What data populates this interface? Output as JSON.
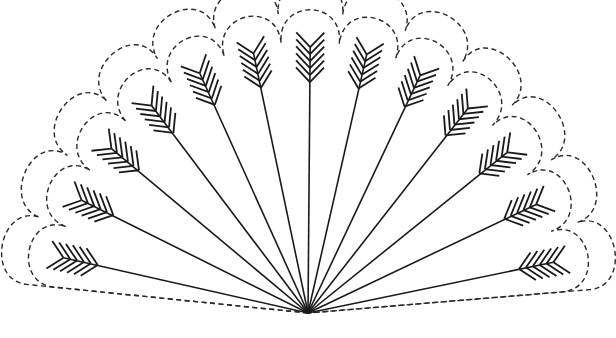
{
  "figure": {
    "arrow_count": 13,
    "apex": [
      308,
      313
    ],
    "radius_x": 250,
    "radius_y": 266,
    "start_angle_deg": 168,
    "end_angle_deg": 11,
    "fletch_pairs": 6,
    "colors": {
      "line": "#1a1a1a",
      "dash": "#2a2a2a",
      "background": "#ffffff"
    }
  }
}
